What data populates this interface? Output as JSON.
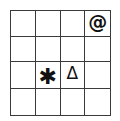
{
  "grid": {
    "rows": 4,
    "cols": 4,
    "line_color": "#3a3a3a",
    "symbols": [
      {
        "row": 0,
        "col": 3,
        "glyph": "@",
        "name": "at-sign"
      },
      {
        "row": 2,
        "col": 1,
        "glyph": "✱",
        "name": "asterisk"
      },
      {
        "row": 2,
        "col": 2,
        "glyph": "Δ",
        "name": "delta-triangle"
      }
    ],
    "cells": [
      [
        "",
        "",
        "",
        "@"
      ],
      [
        "",
        "",
        "",
        ""
      ],
      [
        "",
        "✱",
        "Δ",
        ""
      ],
      [
        "",
        "",
        "",
        ""
      ]
    ]
  }
}
